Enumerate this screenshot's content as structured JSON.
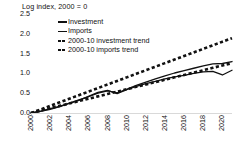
{
  "chart_data": {
    "type": "line",
    "title": "Log index, 2000 = 0",
    "xlabel": "",
    "ylabel": "",
    "ylim": [
      0.0,
      2.5
    ],
    "xlim": [
      2000,
      2021
    ],
    "grid": false,
    "legend_position": "top-left-inside",
    "yticks": [
      "2.5",
      "2.0",
      "1.5",
      "1.0",
      "0.5",
      "0.0"
    ],
    "ytick_values": [
      2.5,
      2.0,
      1.5,
      1.0,
      0.5,
      0.0
    ],
    "xticks": [
      "2000",
      "2002",
      "2004",
      "2006",
      "2008",
      "2010",
      "2012",
      "2014",
      "2016",
      "2018",
      "2020"
    ],
    "xtick_values": [
      2000,
      2002,
      2004,
      2006,
      2008,
      2010,
      2012,
      2014,
      2016,
      2018,
      2020
    ],
    "x": [
      2000,
      2001,
      2002,
      2003,
      2004,
      2005,
      2006,
      2007,
      2008,
      2009,
      2010,
      2011,
      2012,
      2013,
      2014,
      2015,
      2016,
      2017,
      2018,
      2019,
      2020,
      2021
    ],
    "series": [
      {
        "name": "Investment",
        "style": "solid",
        "color": "#111111",
        "values": [
          0.0,
          0.05,
          0.11,
          0.17,
          0.25,
          0.33,
          0.41,
          0.5,
          0.56,
          0.51,
          0.6,
          0.7,
          0.78,
          0.86,
          0.94,
          1.01,
          1.07,
          1.13,
          1.19,
          1.24,
          1.25,
          1.3
        ]
      },
      {
        "name": "Imports",
        "style": "solid",
        "color": "#111111",
        "values": [
          0.0,
          0.04,
          0.09,
          0.16,
          0.24,
          0.32,
          0.42,
          0.52,
          0.57,
          0.49,
          0.59,
          0.67,
          0.74,
          0.8,
          0.86,
          0.91,
          0.95,
          1.0,
          1.04,
          1.05,
          0.96,
          1.08
        ]
      },
      {
        "name": "2000-10 investment trend",
        "style": "dashed",
        "color": "#111111",
        "values": [
          0.0,
          0.06,
          0.12,
          0.18,
          0.24,
          0.3,
          0.36,
          0.42,
          0.48,
          0.54,
          0.6,
          0.66,
          0.72,
          0.78,
          0.84,
          0.9,
          0.96,
          1.02,
          1.08,
          1.14,
          1.2,
          1.26
        ]
      },
      {
        "name": "2000-10 imports trend",
        "style": "dashed",
        "color": "#111111",
        "values": [
          0.0,
          0.09,
          0.18,
          0.27,
          0.36,
          0.45,
          0.54,
          0.63,
          0.72,
          0.81,
          0.9,
          0.99,
          1.08,
          1.17,
          1.26,
          1.35,
          1.44,
          1.53,
          1.62,
          1.71,
          1.8,
          1.89
        ]
      }
    ]
  },
  "legend": {
    "items": [
      {
        "label": "Investment",
        "style": "solid"
      },
      {
        "label": "Imports",
        "style": "solid"
      },
      {
        "label": "2000-10 investment trend",
        "style": "dashed"
      },
      {
        "label": "2000-10 imports trend",
        "style": "dashed"
      }
    ]
  }
}
